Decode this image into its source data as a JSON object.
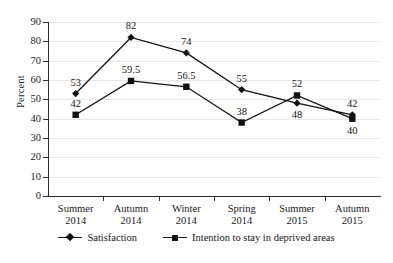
{
  "chart_data": {
    "type": "line",
    "title": "",
    "xlabel": "",
    "ylabel": "Percent",
    "ylim": [
      0,
      90
    ],
    "ytick_step": 10,
    "yticks": [
      0,
      10,
      20,
      30,
      40,
      50,
      60,
      70,
      80,
      90
    ],
    "grid": true,
    "legend_position": "bottom",
    "categories": [
      "Summer 2014",
      "Autumn 2014",
      "Winter 2014",
      "Spring 2014",
      "Summer 2015",
      "Autumn 2015"
    ],
    "category_lines": [
      [
        "Summer",
        "2014"
      ],
      [
        "Autumn",
        "2014"
      ],
      [
        "Winter",
        "2014"
      ],
      [
        "Spring",
        "2014"
      ],
      [
        "Summer",
        "2015"
      ],
      [
        "Autumn",
        "2015"
      ]
    ],
    "series": [
      {
        "name": "Satisfaction",
        "marker": "diamond",
        "color": "#111111",
        "values": [
          53,
          82,
          74,
          55,
          48,
          42
        ],
        "labels": [
          "53",
          "82",
          "74",
          "55",
          "48",
          "42"
        ],
        "label_positions": [
          "above",
          "above",
          "above",
          "above",
          "below",
          "above"
        ]
      },
      {
        "name": "Intention to stay in deprived areas",
        "marker": "square",
        "color": "#111111",
        "values": [
          42,
          59.5,
          56.5,
          38,
          52,
          40
        ],
        "labels": [
          "42",
          "59.5",
          "56.5",
          "38",
          "52",
          "40"
        ],
        "label_positions": [
          "above",
          "above",
          "above",
          "above",
          "above",
          "below"
        ]
      }
    ]
  },
  "axis": {
    "y_title": "Percent"
  },
  "legend": {
    "items": [
      {
        "label": "Satisfaction",
        "marker": "diamond"
      },
      {
        "label": "Intention to stay in deprived areas",
        "marker": "square"
      }
    ]
  }
}
